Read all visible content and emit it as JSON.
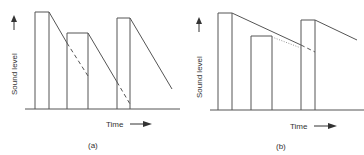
{
  "panels": [
    {
      "id": "a",
      "caption": "(a)",
      "y_label": "Sound level",
      "x_label": "Time"
    },
    {
      "id": "b",
      "caption": "(b)",
      "y_label": "Sound level",
      "x_label": "Time"
    }
  ],
  "colors": {
    "line": "#555555",
    "dotted": "#999999"
  }
}
